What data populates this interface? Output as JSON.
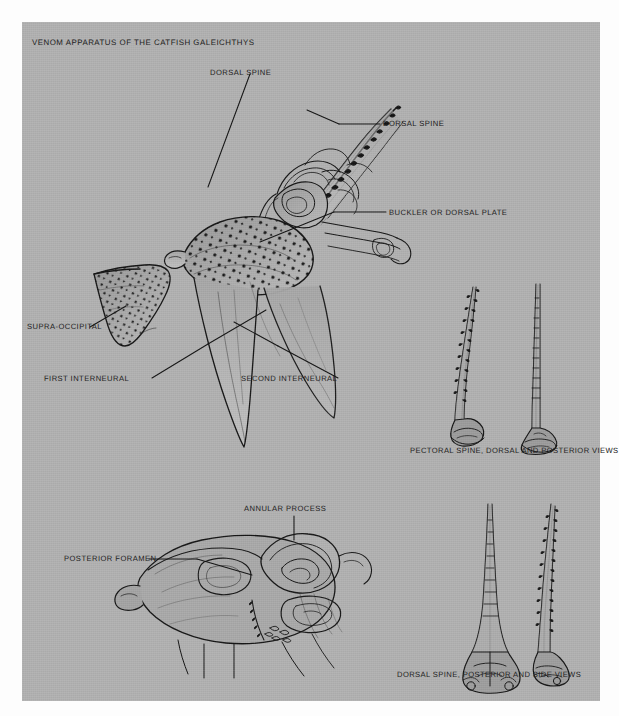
{
  "plate": {
    "title": "VENOM APPARATUS OF THE CATFISH GALEICHTHYS",
    "paper_color": "#b2b2b2",
    "ink_color": "#1a1a1a",
    "background_color": "#fdfdfd"
  },
  "figures": {
    "main_skull": {
      "name": "lateral view of catfish skull with dorsal spine and interneurals",
      "labels": [
        {
          "id": "dorsal-spine-left",
          "text": "DORSAL SPINE"
        },
        {
          "id": "dorsal-spine-right",
          "text": "DORSAL SPINE"
        },
        {
          "id": "buckler",
          "text": "BUCKLER OR DORSAL PLATE"
        },
        {
          "id": "supra-occipital",
          "text": "SUPRA-OCCIPITAL"
        },
        {
          "id": "first-interneural",
          "text": "FIRST INTERNEURAL"
        },
        {
          "id": "second-interneural",
          "text": "SECOND INTERNEURAL"
        }
      ]
    },
    "pectoral_spines": {
      "name": "two pectoral spines",
      "caption": "PECTORAL SPINE, DORSAL AND POSTERIOR VIEWS"
    },
    "basal_bone": {
      "name": "detail of spine base articulation",
      "labels": [
        {
          "id": "annular-process",
          "text": "ANNULAR PROCESS"
        },
        {
          "id": "posterior-foramen",
          "text": "POSTERIOR FORAMEN"
        }
      ]
    },
    "dorsal_spines": {
      "name": "two dorsal spines",
      "caption": "DORSAL SPINE, POSTERIOR AND SIDE VIEWS"
    }
  }
}
